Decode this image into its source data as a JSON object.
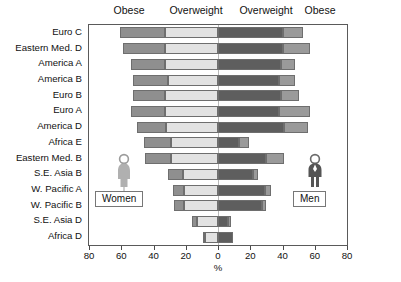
{
  "chart_data": {
    "type": "bar",
    "subtype": "diverging-stacked-population-pyramid",
    "title": "",
    "xlabel": "%",
    "ylabel": "",
    "xlim": [
      -80,
      80
    ],
    "xticks": [
      80,
      60,
      40,
      20,
      0,
      20,
      40,
      60,
      80
    ],
    "grid": false,
    "orientation": "horizontal",
    "top_headers": [
      "Obese",
      "Overweight",
      "Overweight",
      "Obese"
    ],
    "legend": [
      "Women",
      "Men"
    ],
    "legend_position": "inside-bottom-left-and-bottom-right",
    "categories": [
      "Euro C",
      "Eastern Med. D",
      "America A",
      "America B",
      "Euro B",
      "Euro A",
      "America D",
      "Africa E",
      "Eastern Med. B",
      "S.E. Asia B",
      "W. Pacific A",
      "W. Pacific B",
      "S.E. Asia D",
      "Africa D"
    ],
    "series": [
      {
        "name": "Women Obese",
        "side": "left",
        "order": "outer",
        "color": "#8f8f8f",
        "values": [
          28,
          26,
          21,
          22,
          20,
          21,
          18,
          17,
          16,
          9,
          7,
          6,
          3,
          1
        ]
      },
      {
        "name": "Women Overweight",
        "side": "left",
        "order": "inner",
        "color": "#e2e2e2",
        "values": [
          33,
          33,
          33,
          31,
          33,
          33,
          32,
          29,
          29,
          22,
          21,
          21,
          13,
          8
        ]
      },
      {
        "name": "Men Overweight",
        "side": "right",
        "order": "inner",
        "color": "#5e5e5e",
        "values": [
          40,
          40,
          39,
          38,
          39,
          38,
          41,
          13,
          30,
          22,
          29,
          27,
          6,
          9
        ]
      },
      {
        "name": "Men Obese",
        "side": "right",
        "order": "outer",
        "color": "#9a9a9a",
        "values": [
          13,
          17,
          9,
          10,
          11,
          19,
          15,
          6,
          11,
          3,
          4,
          3,
          2,
          0
        ]
      }
    ]
  },
  "axis": {
    "unit_label": "%",
    "tick_labels": [
      "80",
      "60",
      "40",
      "20",
      "0",
      "20",
      "40",
      "60",
      "80"
    ]
  },
  "legend": {
    "women_label": "Women",
    "men_label": "Men",
    "women_icon": "female-figure-icon",
    "men_icon": "male-figure-icon"
  },
  "colors": {
    "women_obese": "#8f8f8f",
    "women_overweight": "#e2e2e2",
    "men_overweight": "#5e5e5e",
    "men_obese": "#9a9a9a",
    "frame": "#5a5a5a",
    "background": "#ffffff"
  }
}
